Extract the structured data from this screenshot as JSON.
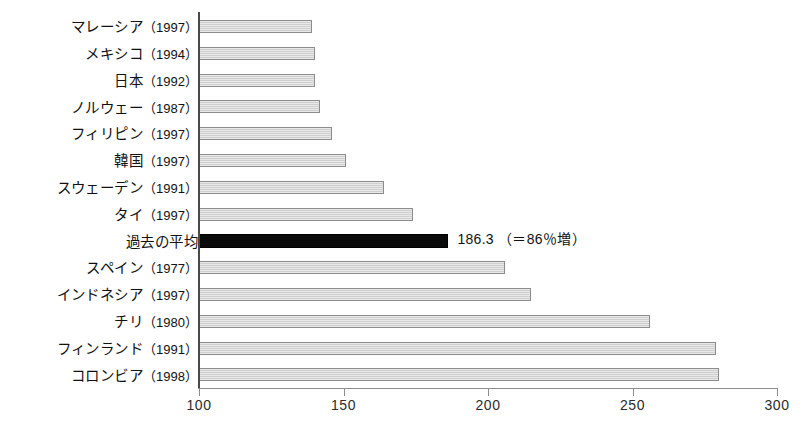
{
  "chart_data": {
    "type": "bar",
    "orientation": "horizontal",
    "title": "",
    "subtitle": "",
    "xlabel": "",
    "ylabel": "",
    "xlim": [
      100,
      300
    ],
    "xticks": [
      100,
      150,
      200,
      250,
      300
    ],
    "xtick_labels": [
      "100",
      "150",
      "200",
      "250",
      "300"
    ],
    "grid": false,
    "legend": "none",
    "categories": [
      "マレーシア（1997）",
      "メキシコ（1994）",
      "日本（1992）",
      "ノルウェー（1987）",
      "フィリピン（1997）",
      "韓国（1997）",
      "スウェーデン（1991）",
      "タイ（1997）",
      "過去の平均",
      "スペイン（1977）",
      "インドネシア（1997）",
      "チリ（1980）",
      "フィンランド（1991）",
      "コロンビア（1998）"
    ],
    "values": [
      139,
      140,
      140,
      142,
      146,
      151,
      164,
      174,
      186.3,
      206,
      215,
      256,
      279,
      280
    ],
    "rows": [
      {
        "country": "マレーシア",
        "year": "（1997）",
        "value": 139,
        "highlight": false,
        "annotation": ""
      },
      {
        "country": "メキシコ",
        "year": "（1994）",
        "value": 140,
        "highlight": false,
        "annotation": ""
      },
      {
        "country": "日本",
        "year": "（1992）",
        "value": 140,
        "highlight": false,
        "annotation": ""
      },
      {
        "country": "ノルウェー",
        "year": "（1987）",
        "value": 142,
        "highlight": false,
        "annotation": ""
      },
      {
        "country": "フィリピン",
        "year": "（1997）",
        "value": 146,
        "highlight": false,
        "annotation": ""
      },
      {
        "country": "韓国",
        "year": "（1997）",
        "value": 151,
        "highlight": false,
        "annotation": ""
      },
      {
        "country": "スウェーデン",
        "year": "（1991）",
        "value": 164,
        "highlight": false,
        "annotation": ""
      },
      {
        "country": "タイ",
        "year": "（1997）",
        "value": 174,
        "highlight": false,
        "annotation": ""
      },
      {
        "country": "過去の平均",
        "year": "",
        "value": 186.3,
        "highlight": true,
        "annotation": "186.3 （＝86％増）"
      },
      {
        "country": "スペイン",
        "year": "（1977）",
        "value": 206,
        "highlight": false,
        "annotation": ""
      },
      {
        "country": "インドネシア",
        "year": "（1997）",
        "value": 215,
        "highlight": false,
        "annotation": ""
      },
      {
        "country": "チリ",
        "year": "（1980）",
        "value": 256,
        "highlight": false,
        "annotation": ""
      },
      {
        "country": "フィンランド",
        "year": "（1991）",
        "value": 279,
        "highlight": false,
        "annotation": ""
      },
      {
        "country": "コロンビア",
        "year": "（1998）",
        "value": 280,
        "highlight": false,
        "annotation": ""
      }
    ],
    "colors": {
      "bar_fill": "#cfcfcf",
      "bar_border": "#8c8c8c",
      "highlight_fill": "#0b0b0b",
      "axis": "#4a4a4a",
      "text": "#111111",
      "background": "#ffffff"
    }
  }
}
